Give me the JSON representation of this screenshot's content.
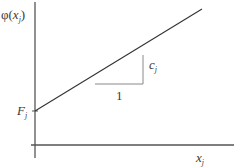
{
  "diagram": {
    "y_axis_label": {
      "base": "φ(",
      "var": "x",
      "sub": "j",
      "close": ")"
    },
    "x_axis_label": {
      "var": "x",
      "sub": "j"
    },
    "intercept_label": {
      "var": "F",
      "sub": "j"
    },
    "run_label": "1",
    "rise_label": {
      "var": "c",
      "sub": "j"
    },
    "colors": {
      "axis": "#555555",
      "line": "#333333",
      "triangle": "#888888"
    }
  }
}
